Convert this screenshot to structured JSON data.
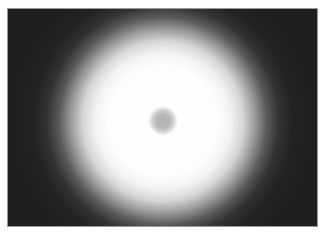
{
  "image": {
    "description": "Blurred grayscale photograph of a bright circular glow with a small gray spot at its center on a dark background",
    "colors": {
      "background": "#1f1f1f",
      "glow": "#ffffff",
      "center_spot": "#b4b4b4",
      "border": "#9a9a9a"
    }
  }
}
